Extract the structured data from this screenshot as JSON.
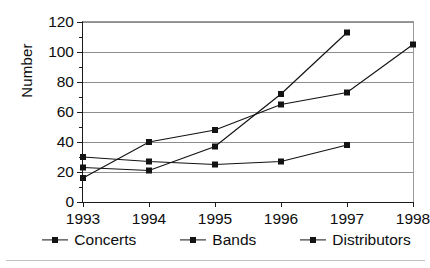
{
  "chart_data": {
    "type": "line",
    "title": "",
    "xlabel": "",
    "ylabel": "Number",
    "categories": [
      "1993",
      "1994",
      "1995",
      "1996",
      "1997",
      "1998"
    ],
    "x": [
      1993,
      1994,
      1995,
      1996,
      1997,
      1998
    ],
    "xlim": [
      1993,
      1998
    ],
    "ylim": [
      0,
      120
    ],
    "y_ticks": [
      0,
      20,
      40,
      60,
      80,
      100,
      120
    ],
    "y_minor_ticks": [
      10,
      30,
      50,
      70,
      90,
      110
    ],
    "grid": true,
    "legend_position": "bottom",
    "marker": "square",
    "series": [
      {
        "name": "Concerts",
        "color": "#131313",
        "values": [
          23,
          21,
          37,
          72,
          113,
          null
        ]
      },
      {
        "name": "Bands",
        "color": "#131313",
        "values": [
          16,
          40,
          48,
          65,
          73,
          105
        ]
      },
      {
        "name": "Distributors",
        "color": "#131313",
        "values": [
          30,
          27,
          25,
          27,
          38,
          null
        ]
      }
    ]
  },
  "legend": {
    "items": [
      {
        "label": "Concerts"
      },
      {
        "label": "Bands"
      },
      {
        "label": "Distributors"
      }
    ]
  }
}
